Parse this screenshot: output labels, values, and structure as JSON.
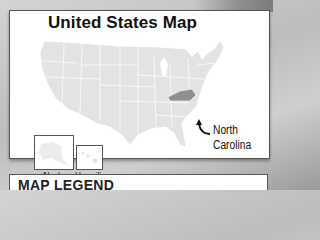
{
  "map": {
    "title": "United States Map",
    "highlighted_state": {
      "name": "North Carolina",
      "label_line1": "North",
      "label_line2": "Carolina",
      "color": "#8f8f8f"
    },
    "base_color": "#e3e3e3",
    "border_color": "#ffffff",
    "insets": [
      {
        "label": "Alaska"
      },
      {
        "label": "Hawai'i"
      }
    ]
  },
  "legend": {
    "title": "MAP LEGEND"
  }
}
